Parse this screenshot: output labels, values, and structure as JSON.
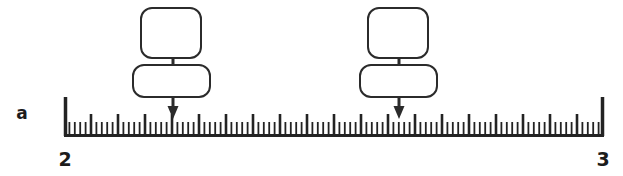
{
  "figure": {
    "label": "a",
    "caption_letter": "a"
  },
  "scale": {
    "start_label": "2",
    "end_label": "3",
    "start_value": 2,
    "end_value": 3,
    "minor_divisions": 100,
    "major_every": 5,
    "major_divisions": 20,
    "minor_step": 0.01,
    "major_step": 0.05,
    "x_start_px": 64,
    "x_end_px": 604,
    "baseline_y_px": 135,
    "minor_tick_height_px": 13,
    "major_tick_height_px": 21,
    "end_tick_height_px": 38
  },
  "markers": [
    {
      "name": "marker-left",
      "value": 2.2,
      "tick_index": 20,
      "arrow_x_px": 173,
      "arrow_tip_y_px": 119,
      "upper_box": {
        "x": 141,
        "y": 8,
        "width": 60,
        "height": 50,
        "radius": 11,
        "text": ""
      },
      "lower_box": {
        "x": 133,
        "y": 65,
        "width": 77,
        "height": 32,
        "radius": 11,
        "text": ""
      }
    },
    {
      "name": "marker-right",
      "value": 2.62,
      "tick_index": 62,
      "arrow_x_px": 399,
      "arrow_tip_y_px": 119,
      "upper_box": {
        "x": 368,
        "y": 8,
        "width": 60,
        "height": 50,
        "radius": 11,
        "text": ""
      },
      "lower_box": {
        "x": 360,
        "y": 65,
        "width": 77,
        "height": 32,
        "radius": 11,
        "text": ""
      }
    }
  ],
  "colors": {
    "ink": "#232323",
    "box_stroke": "#2b2b2b",
    "background": "#ffffff",
    "text": "#1c1c1c"
  }
}
